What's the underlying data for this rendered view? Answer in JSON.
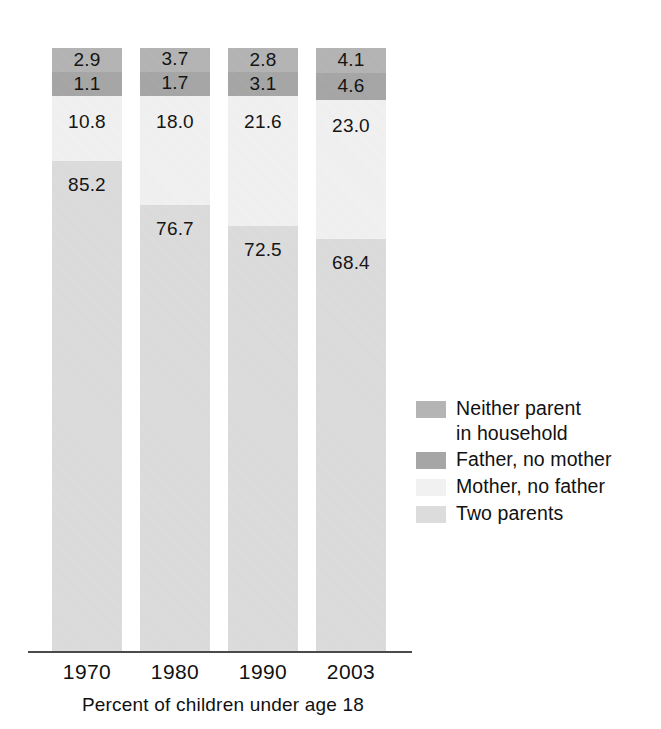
{
  "chart_data": {
    "type": "bar",
    "subtype": "stacked-bar-vertical",
    "title": "",
    "subtitle": "",
    "xlabel": "Percent of children under age 18",
    "ylabel": "",
    "ylim": [
      0,
      100
    ],
    "grid": false,
    "legend_position": "right",
    "categories": [
      "1970",
      "1980",
      "1990",
      "2003"
    ],
    "stack_order_top_to_bottom": [
      "Neither parent in household",
      "Father, no mother",
      "Mother, no father",
      "Two parents"
    ],
    "series": [
      {
        "name": "Neither parent in household",
        "color": "#b4b4b4",
        "values": [
          2.9,
          3.7,
          2.8,
          4.1
        ],
        "labels": [
          "2.9",
          "3.7",
          "2.8",
          "4.1"
        ]
      },
      {
        "name": "Father, no mother",
        "color": "#a6a6a6",
        "values": [
          1.1,
          1.7,
          3.1,
          4.6
        ],
        "labels": [
          "1.1",
          "1.7",
          "3.1",
          "4.6"
        ]
      },
      {
        "name": "Mother, no father",
        "color": "#f1f1f1",
        "values": [
          10.8,
          18.0,
          21.6,
          23.0
        ],
        "labels": [
          "10.8",
          "18.0",
          "21.6",
          "23.0"
        ]
      },
      {
        "name": "Two parents",
        "color": "#dcdcdc",
        "values": [
          85.2,
          76.7,
          72.5,
          68.4
        ],
        "labels": [
          "85.2",
          "76.7",
          "72.5",
          "68.4"
        ]
      }
    ]
  },
  "axis": {
    "ticks": [
      "1970",
      "1980",
      "1990",
      "2003"
    ],
    "caption": "Percent of children under age 18",
    "line_color": "#4a4a4a"
  },
  "legend": {
    "items": [
      {
        "label": "Neither parent\nin household",
        "color": "#b4b4b4"
      },
      {
        "label": "Father, no mother",
        "color": "#a6a6a6"
      },
      {
        "label": "Mother, no father",
        "color": "#f1f1f1"
      },
      {
        "label": "Two parents",
        "color": "#dcdcdc"
      }
    ]
  },
  "colors": {
    "background": "#ffffff",
    "text": "#111111",
    "neither_parent": "#b4b4b4",
    "father_no_mother": "#a6a6a6",
    "mother_no_father": "#f1f1f1",
    "two_parents": "#dcdcdc",
    "axis": "#4a4a4a"
  }
}
